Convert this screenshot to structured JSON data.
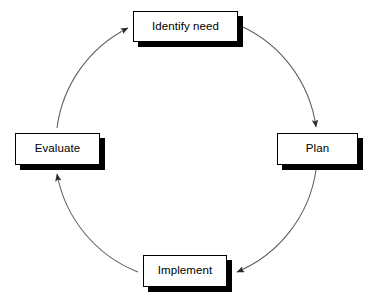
{
  "diagram": {
    "type": "cycle-flow-diagram",
    "direction": "clockwise",
    "background_color": "#ffffff",
    "node_fill_color": "#ffffff",
    "node_border_color": "#000000",
    "node_shadow_color": "#000000",
    "arc_color": "#595959",
    "text_color": "#000000",
    "nodes": [
      {
        "id": "identify-need",
        "label": "Identify need",
        "position": "top"
      },
      {
        "id": "plan",
        "label": "Plan",
        "position": "right"
      },
      {
        "id": "implement",
        "label": "Implement",
        "position": "bottom"
      },
      {
        "id": "evaluate",
        "label": "Evaluate",
        "position": "left"
      }
    ],
    "connectors": [
      {
        "id": "identify-need-to-plan",
        "from": "Identify need",
        "to": "Plan",
        "style": "curved-arrow"
      },
      {
        "id": "plan-to-implement",
        "from": "Plan",
        "to": "Implement",
        "style": "curved-arrow"
      },
      {
        "id": "implement-to-evaluate",
        "from": "Implement",
        "to": "Evaluate",
        "style": "curved-arrow"
      },
      {
        "id": "evaluate-to-identify-need",
        "from": "Evaluate",
        "to": "Identify need",
        "style": "curved-arrow"
      }
    ]
  }
}
